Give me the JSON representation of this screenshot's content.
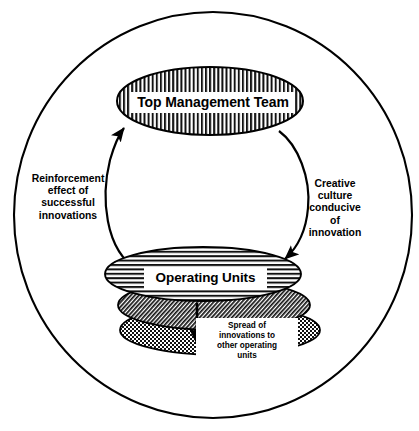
{
  "diagram": {
    "outer_boundary": {
      "name": "organization-boundary",
      "shape": "circle"
    },
    "nodes": [
      {
        "id": "top-management-team",
        "label": "Top Management Team",
        "fill_pattern": "vertical-stripes",
        "shape": "ellipse"
      },
      {
        "id": "operating-units",
        "label": "Operating Units",
        "fill_pattern": "horizontal-stripes",
        "shape": "ellipse"
      },
      {
        "id": "operating-unit-second",
        "label": "",
        "fill_pattern": "diagonal-hatch",
        "shape": "ellipse"
      },
      {
        "id": "operating-unit-third",
        "label": "",
        "fill_pattern": "checker-dots",
        "shape": "ellipse"
      }
    ],
    "arrows": [
      {
        "id": "reinforcement-arrow",
        "from": "operating-units",
        "to": "top-management-team",
        "label": "Reinforcement\neffect of\nsuccessful\ninnovations"
      },
      {
        "id": "creative-culture-arrow",
        "from": "top-management-team",
        "to": "operating-units",
        "label": "Creative\nculture\nconducive\nof\ninnovation"
      },
      {
        "id": "spread-arrow",
        "from": "operating-units",
        "to": "operating-unit-third",
        "label": "Spread of\ninnovations to\nother operating\nunits"
      }
    ],
    "colors": {
      "stroke": "#000000",
      "fill": "#ffffff",
      "text": "#000000"
    }
  }
}
